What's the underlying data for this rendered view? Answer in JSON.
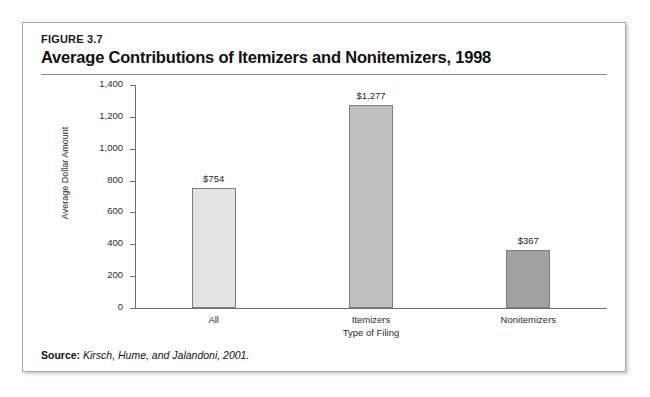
{
  "figure": {
    "number": "FIGURE 3.7",
    "title": "Average Contributions of Itemizers and Nonitemizers, 1998"
  },
  "source": {
    "label": "Source:",
    "text": "Kirsch, Hume, and Jalandoni, 2001."
  },
  "chart_data": {
    "type": "bar",
    "title": "Average Contributions of Itemizers and Nonitemizers, 1998",
    "categories": [
      "All",
      "Itemizers",
      "Nonitemizers"
    ],
    "values": [
      754,
      1277,
      367
    ],
    "value_labels": [
      "$754",
      "$1,277",
      "$367"
    ],
    "xlabel": "Type of Filing",
    "ylabel": "Average Dollar Amount",
    "ylim": [
      0,
      1400
    ],
    "ytick_values": [
      0,
      200,
      400,
      600,
      800,
      1000,
      1200,
      1400
    ],
    "ytick_labels": [
      "0",
      "200",
      "400",
      "600",
      "800",
      "1,000",
      "1,200",
      "1,400"
    ],
    "grid": false,
    "legend": false,
    "bar_colors": [
      "#e3e3e3",
      "#bfbfbf",
      "#a3a3a3"
    ],
    "bar_border_color": "#7d7d7d"
  }
}
